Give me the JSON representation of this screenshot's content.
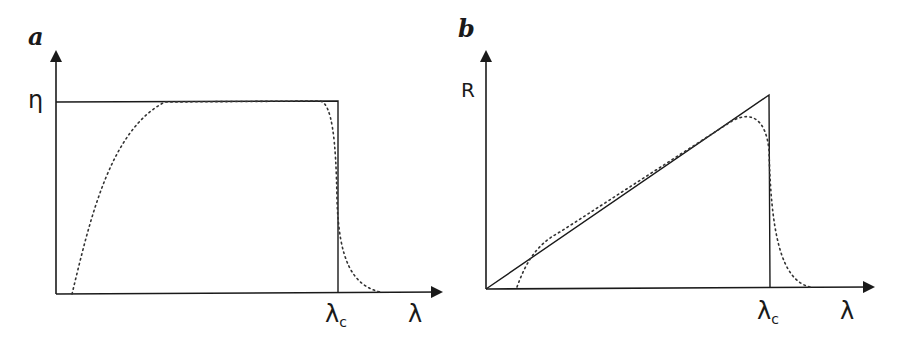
{
  "panels": [
    {
      "letter": "a",
      "y_label": "η",
      "x_label": "λ",
      "cutoff_label": "λ",
      "cutoff_sub": "c",
      "description": "Ideal (rectangular) quantum efficiency vs wavelength with realistic dotted curve"
    },
    {
      "letter": "b",
      "y_label": "R",
      "x_label": "λ",
      "cutoff_label": "λ",
      "cutoff_sub": "c",
      "description": "Ideal responsivity rising linearly with wavelength up to cutoff, with realistic dotted curve"
    }
  ],
  "colors": {
    "line": "#1a1a1a",
    "dotted": "#333333"
  }
}
